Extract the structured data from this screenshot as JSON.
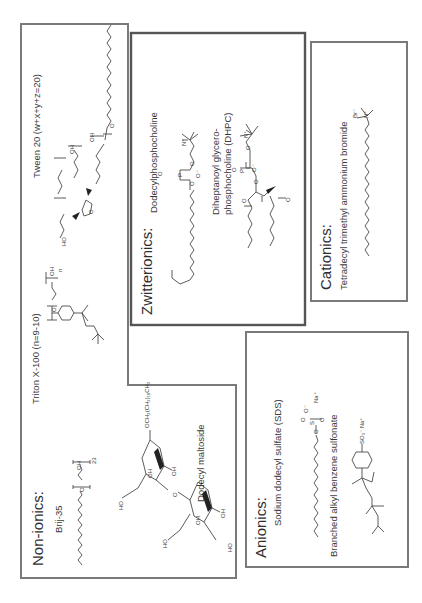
{
  "figure": {
    "orientation": "rotated-90-ccw",
    "colors": {
      "box_border": "#7a7a7a",
      "box_border_dark": "#555555",
      "bond": "#4a4a4a",
      "text": "#3a3a3a",
      "background": "#ffffff"
    }
  },
  "groups": {
    "nonionics": {
      "title": "Non-ionics:",
      "compounds": [
        {
          "name": "Brij-35",
          "annotations": {
            "oxygen": "O",
            "hydroxyl": "OH",
            "repeat": "23"
          }
        },
        {
          "name": "Triton X-100 (n=9-10)",
          "annotations": {
            "oxygen": "O",
            "hydroxyl": "OH",
            "repeat": "n"
          }
        },
        {
          "name": "Tween 20 (w+x+y+z=20)",
          "annotations": {
            "hydroxyl": "OH",
            "oxygen": "O",
            "ho": "HO"
          }
        },
        {
          "name": "Dodecyl maltoside",
          "annotations": {
            "tail": "OCH₂(CH₂)₁₀CH₃",
            "hydroxyl": "OH",
            "ho": "HO",
            "oxygen": "O"
          }
        }
      ]
    },
    "zwitterionics": {
      "title": "Zwitterionics:",
      "compounds": [
        {
          "name": "Dodecylphosphocholine",
          "annotations": {
            "phosphorus": "P",
            "oxygen": "O",
            "o_minus": "O⁻",
            "n_plus": "N⁺"
          }
        },
        {
          "name_line1": "Diheptanoyl glycero-",
          "name_line2": "phosphocholine (DHPC)",
          "annotations": {
            "phosphorus": "P",
            "oxygen": "O",
            "o_minus": "O⁻",
            "n_plus": "N⁺"
          }
        }
      ]
    },
    "cationics": {
      "title": "Cationics:",
      "compounds": [
        {
          "name": "Tetradecyl trimethyl ammonium bromide",
          "annotations": {
            "br": "Br⁻",
            "n_plus": "N⁺"
          }
        }
      ]
    },
    "anionics": {
      "title": "Anionics:",
      "compounds": [
        {
          "name": "Sodium dodecyl sulfate (SDS)",
          "annotations": {
            "sulfur": "S",
            "oxygen": "O",
            "o_minus": "O⁻",
            "na": "Na⁺"
          }
        },
        {
          "name": "Branched alkyl benzene sulfonate",
          "annotations": {
            "so3": "SO₃⁻ Na⁺"
          }
        }
      ]
    }
  }
}
